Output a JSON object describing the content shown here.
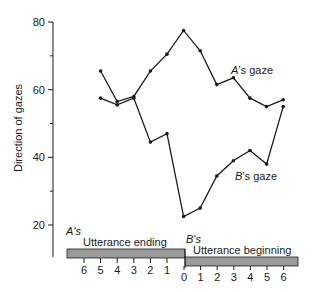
{
  "chart_data": {
    "type": "line",
    "title": "",
    "xlabel": "",
    "ylabel": "Direction of gazes",
    "ylim": [
      10,
      80
    ],
    "yticks": [
      20,
      40,
      60,
      80
    ],
    "y_minor_ticks": [
      30,
      50,
      70
    ],
    "x": [
      "A6",
      "A5",
      "A4",
      "A3",
      "A2",
      "A1",
      "0",
      "B1",
      "B2",
      "B3",
      "B4",
      "B5",
      "B6"
    ],
    "x_tick_labels_ending": [
      "6",
      "5",
      "4",
      "3",
      "2",
      "1"
    ],
    "x_tick_labels_beginning": [
      "0",
      "1",
      "2",
      "3",
      "4",
      "5",
      "6"
    ],
    "series": [
      {
        "name": "A's gaze",
        "x": [
          "A5",
          "A4",
          "A3",
          "A2",
          "A1",
          "0",
          "B1",
          "B2",
          "B3",
          "B4",
          "B5",
          "B6"
        ],
        "values": [
          65.5,
          56.5,
          58,
          65.5,
          70.5,
          77.5,
          71.5,
          61.5,
          63.5,
          57.5,
          55,
          57
        ]
      },
      {
        "name": "B's gaze",
        "x": [
          "A5",
          "A4",
          "A3",
          "A2",
          "A1",
          "0",
          "B1",
          "B2",
          "B3",
          "B4",
          "B5",
          "B6"
        ],
        "values": [
          57.5,
          55.5,
          57.5,
          44.5,
          47,
          22.5,
          25,
          34.5,
          39,
          42,
          38,
          55
        ]
      }
    ],
    "annotations": {
      "a_speaker": "A's",
      "a_segment": "Utterance ending",
      "b_speaker": "B's",
      "b_segment": "Utterance beginning"
    },
    "grid": false,
    "legend": "inline labels"
  }
}
